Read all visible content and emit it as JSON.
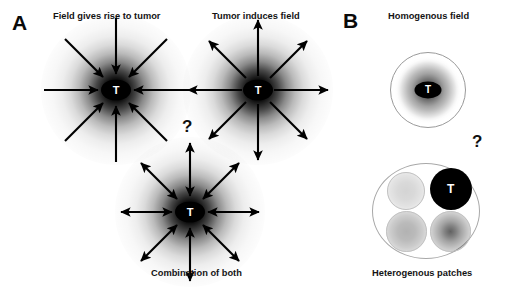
{
  "figure": {
    "background_color": "#ffffff",
    "panels": [
      {
        "letter": "A",
        "question_mark": "?",
        "diagrams": [
          {
            "title": "Field gives rise to tumor",
            "tumor_label": "T",
            "arrow_direction": "inward",
            "arrow_count": 8,
            "field_style": "radial-gradient-dark-center"
          },
          {
            "title": "Tumor induces field",
            "tumor_label": "T",
            "arrow_direction": "outward",
            "arrow_count": 8,
            "field_style": "radial-gradient-dark-center"
          },
          {
            "title": "Combination of both",
            "tumor_label": "T",
            "arrow_direction": "bidirectional",
            "arrow_count": 8,
            "field_style": "radial-gradient-dark-center"
          }
        ]
      },
      {
        "letter": "B",
        "question_mark": "?",
        "diagrams": [
          {
            "title": "Homogenous field",
            "tumor_label": "T",
            "shape": "circle-with-radial-gradient",
            "outline_color": "#9a9a9a"
          },
          {
            "title": "Heterogenous patches",
            "tumor_label": "T",
            "shape": "circle-with-four-patches",
            "outline_color": "#a8a8a8",
            "patches": [
              {
                "position": "top-left",
                "shade": "light-gray",
                "tumor": false
              },
              {
                "position": "top-right",
                "shade": "solid-black",
                "tumor": true
              },
              {
                "position": "bottom-left",
                "shade": "medium-gray",
                "tumor": false
              },
              {
                "position": "bottom-right",
                "shade": "gray-dark-center",
                "tumor": false
              }
            ]
          }
        ]
      }
    ],
    "colors": {
      "ink": "#000000",
      "text": "#141414",
      "outline_light": "#a8a8a8",
      "outline_mid": "#9a9a9a",
      "patch_border": "#c2c2c2"
    }
  }
}
